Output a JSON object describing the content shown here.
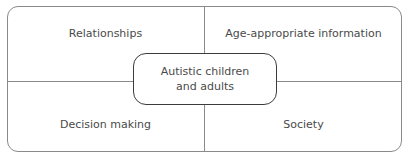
{
  "diagram": {
    "center": {
      "line1": "Autistic children",
      "line2": "and adults"
    },
    "quadrants": {
      "top_left": "Relationships",
      "top_right": "Age-appropriate information",
      "bottom_left": "Decision making",
      "bottom_right": "Society"
    }
  }
}
